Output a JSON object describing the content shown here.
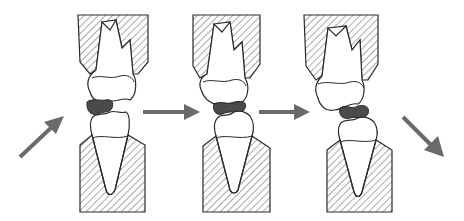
{
  "diagram": {
    "colors": {
      "background": "#ffffff",
      "outline": "#2a2a2a",
      "hatch": "#555555",
      "bolus": "#4a4a4a",
      "arrow": "#6a6a6a"
    },
    "stages": [
      {
        "id": "stage-1",
        "bolus_state": "intact"
      },
      {
        "id": "stage-2",
        "bolus_state": "compressed"
      },
      {
        "id": "stage-3",
        "bolus_state": "released"
      }
    ],
    "arrows": [
      {
        "id": "arrow-in",
        "direction": "up-right"
      },
      {
        "id": "arrow-1-2",
        "direction": "right"
      },
      {
        "id": "arrow-2-3",
        "direction": "right"
      },
      {
        "id": "arrow-out",
        "direction": "down-right"
      }
    ]
  }
}
